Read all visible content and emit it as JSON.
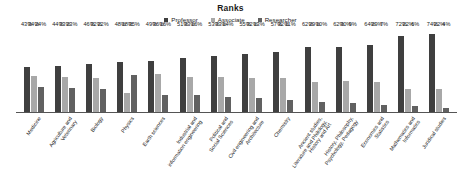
{
  "chart_data": {
    "type": "bar",
    "title": "Ranks",
    "xlabel": "",
    "ylabel": "",
    "ylim": [
      0,
      80
    ],
    "grid": false,
    "legend_position": "top-center",
    "value_suffix": "%",
    "categories": [
      "Medicine",
      "Agriculture and Veterinary",
      "Biology",
      "Physics",
      "Earth sciences",
      "Industrial and information engineering",
      "Political and Social Sciences",
      "Civil engineering and Architecture",
      "Chemistry",
      "Ancient studies, Literature and Philology, History and Art",
      "History, Philosophy, Psychology, Pedagogy",
      "Economics and Statistics",
      "Mathematics and Informatics",
      "Juridical studies"
    ],
    "category_lines": [
      [
        "Medicine"
      ],
      [
        "Agriculture and",
        "Veterinary"
      ],
      [
        "Biology"
      ],
      [
        "Physics"
      ],
      [
        "Earth sciences"
      ],
      [
        "Industrial and",
        "information engineering"
      ],
      [
        "Political and",
        "Social Sciences"
      ],
      [
        "Civil engineering and",
        "Architecture"
      ],
      [
        "Chemistry"
      ],
      [
        "Ancient studies,",
        "Literature and Philology,",
        "History and Art"
      ],
      [
        "History, Philosophy,",
        "Psychology, Pedagogy"
      ],
      [
        "Economics and",
        "Statistics"
      ],
      [
        "Mathematics and",
        "Informatics"
      ],
      [
        "Juridical studies"
      ]
    ],
    "series": [
      {
        "name": "Professor",
        "color": "#3f3f3f",
        "values": [
          43,
          44,
          46,
          48,
          49,
          51,
          53,
          55,
          57,
          62,
          62,
          64,
          72,
          74
        ],
        "labels": [
          "43%",
          "44%",
          "46%",
          "48%",
          "49%",
          "51%",
          "53%",
          "55%",
          "57%",
          "62%",
          "62%",
          "64%",
          "72%",
          "74%"
        ]
      },
      {
        "name": "Associate",
        "color": "#a8a8a8",
        "values": [
          34,
          33,
          32,
          18,
          36,
          33,
          33,
          32,
          32,
          29,
          30,
          29,
          22,
          22
        ],
        "labels": [
          "34%",
          "33%",
          "32%",
          "18%",
          "36%",
          "33%",
          "33%",
          "32%",
          "32%",
          "29%",
          "30%",
          "29%",
          "22%",
          "22%"
        ]
      },
      {
        "name": "Researcher",
        "color": "#616161",
        "values": [
          24,
          23,
          22,
          35,
          16,
          16,
          14,
          13,
          11,
          10,
          9,
          7,
          6,
          4
        ],
        "labels": [
          "24%",
          "23%",
          "22%",
          "35%",
          "16%",
          "16%",
          "14%",
          "13%",
          "11%",
          "10%",
          "9%",
          "7%",
          "6%",
          "4%"
        ]
      }
    ]
  },
  "legend": {
    "items": [
      {
        "label": "Professor"
      },
      {
        "label": "Associate"
      },
      {
        "label": "Researcher"
      }
    ]
  }
}
